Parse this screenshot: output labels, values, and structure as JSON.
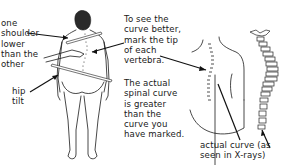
{
  "labels": {
    "shoulder": "one\nshoulder\nlower\nthan the\nother",
    "hip": "hip\ntilt",
    "mark_tip": "To see the\ncurve better,\nmark the tip\nof each\nvertebra.",
    "actual_greater": "The actual\nspinal curve\nis greater\nthan the\ncurve you\nhave marked.",
    "xray": "actual curve (as\nseen in X-rays)"
  },
  "figures": [
    {
      "name": "standing-person-back-view",
      "description": "person viewed from behind with hand marking spine"
    },
    {
      "name": "back-with-marked-vertebrae",
      "description": "close-up of back with dotted vertebra marks"
    },
    {
      "name": "spine-xray-vertebrae",
      "description": "stacked vertebrae showing actual curve"
    }
  ]
}
